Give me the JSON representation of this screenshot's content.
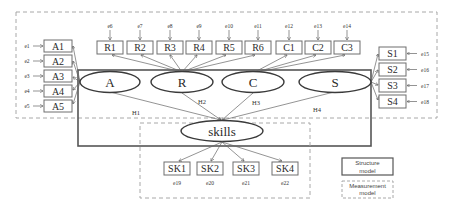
{
  "diagram": {
    "type": "structural-equation-model",
    "latent_variables": [
      {
        "id": "A",
        "label": "A"
      },
      {
        "id": "R",
        "label": "R"
      },
      {
        "id": "C",
        "label": "C"
      },
      {
        "id": "S",
        "label": "S"
      }
    ],
    "outcome": {
      "id": "skills",
      "label": "skills"
    },
    "indicators": {
      "A": [
        {
          "label": "A1",
          "error": "e1"
        },
        {
          "label": "A2",
          "error": "e2"
        },
        {
          "label": "A3",
          "error": "e3"
        },
        {
          "label": "A4",
          "error": "e4"
        },
        {
          "label": "A5",
          "error": "e5"
        }
      ],
      "R": [
        {
          "label": "R1",
          "error": "e6"
        },
        {
          "label": "R2",
          "error": "e7"
        },
        {
          "label": "R3",
          "error": "e8"
        },
        {
          "label": "R4",
          "error": "e9"
        },
        {
          "label": "R5",
          "error": "e10"
        },
        {
          "label": "R6",
          "error": "e11"
        }
      ],
      "C": [
        {
          "label": "C1",
          "error": "e12"
        },
        {
          "label": "C2",
          "error": "e13"
        },
        {
          "label": "C3",
          "error": "e14"
        }
      ],
      "S": [
        {
          "label": "S1",
          "error": "e15"
        },
        {
          "label": "S2",
          "error": "e16"
        },
        {
          "label": "S3",
          "error": "e17"
        },
        {
          "label": "S4",
          "error": "e18"
        }
      ],
      "skills": [
        {
          "label": "SK1",
          "error": "e19"
        },
        {
          "label": "SK2",
          "error": "e20"
        },
        {
          "label": "SK3",
          "error": "e21"
        },
        {
          "label": "SK4",
          "error": "e22"
        }
      ]
    },
    "hypotheses": [
      {
        "label": "H1",
        "from": "A",
        "to": "skills"
      },
      {
        "label": "H2",
        "from": "R",
        "to": "skills"
      },
      {
        "label": "H3",
        "from": "C",
        "to": "skills"
      },
      {
        "label": "H4",
        "from": "S",
        "to": "skills"
      }
    ],
    "legend": {
      "structure": {
        "line1": "Structure",
        "line2": "model"
      },
      "measurement": {
        "line1": "Measurement",
        "line2": "model"
      }
    }
  }
}
